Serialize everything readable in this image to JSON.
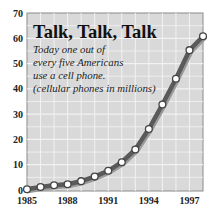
{
  "title": "Talk, Talk, Talk",
  "subtitle_lines": [
    "Today one out of",
    "every five Americans",
    "use a cell phone.",
    "(cellular phones in millions)"
  ],
  "colors": {
    "plot_background": "#d9d9d9",
    "grid": "#f2f2f2",
    "line": "#5a5a5a",
    "marker_fill": "#ffffff",
    "frame": "#8a8a8a"
  },
  "chart_data": {
    "type": "line",
    "title": "Talk, Talk, Talk",
    "subtitle": "Today one out of every five Americans use a cell phone. (cellular phones in millions)",
    "xlabel": "",
    "ylabel": "cellular phones in millions",
    "x": [
      1985,
      1986,
      1987,
      1988,
      1989,
      1990,
      1991,
      1992,
      1993,
      1994,
      1995,
      1996,
      1997,
      1998
    ],
    "series": [
      {
        "name": "Cellular phones (millions)",
        "values": [
          0.3,
          1.2,
          1.9,
          2.3,
          3.5,
          5.3,
          7.6,
          11.0,
          16.0,
          24.1,
          33.8,
          44.0,
          55.3,
          60.8
        ]
      }
    ],
    "xticks": [
      "1985",
      "1988",
      "1991",
      "1994",
      "1997"
    ],
    "yticks": [
      "0",
      "10",
      "20",
      "30",
      "40",
      "50",
      "60",
      "70"
    ],
    "xlim": [
      1985,
      1998
    ],
    "ylim": [
      0,
      70
    ],
    "grid": true,
    "legend": "none"
  }
}
